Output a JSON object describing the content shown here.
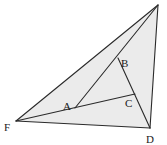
{
  "diagram": {
    "type": "geometry-triangle",
    "fill_color": "#ebebeb",
    "stroke_color": "#2a2a2a",
    "vertices": {
      "top": {
        "x": 158,
        "y": 5,
        "label": ""
      },
      "F": {
        "x": 16,
        "y": 121,
        "label": "F"
      },
      "D": {
        "x": 150,
        "y": 128,
        "label": "D"
      },
      "A": {
        "x": 75,
        "y": 108,
        "label": "A"
      },
      "B": {
        "x": 118,
        "y": 58,
        "label": "B"
      },
      "C": {
        "x": 135,
        "y": 94,
        "label": "C"
      }
    },
    "labels": {
      "F": "F",
      "D": "D",
      "A": "A",
      "B": "B",
      "C": "C"
    },
    "segments": [
      [
        "F",
        "top"
      ],
      [
        "top",
        "D"
      ],
      [
        "D",
        "F"
      ],
      [
        "F",
        "C"
      ],
      [
        "A",
        "top"
      ],
      [
        "B",
        "D"
      ]
    ]
  }
}
